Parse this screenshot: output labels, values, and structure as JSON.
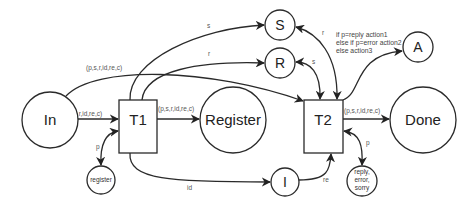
{
  "diagram": {
    "type": "petri-net",
    "places": {
      "in": {
        "label": "In"
      },
      "register_big": {
        "label": "Register"
      },
      "done": {
        "label": "Done"
      },
      "s": {
        "label": "S"
      },
      "r": {
        "label": "R"
      },
      "a": {
        "label": "A"
      },
      "i": {
        "label": "I"
      },
      "register_small": {
        "label": "register"
      },
      "reply": {
        "lines": [
          "reply,",
          "error,",
          "sorry"
        ]
      }
    },
    "transitions": {
      "t1": {
        "label": "T1"
      },
      "t2": {
        "label": "T2"
      }
    },
    "arcs": {
      "in_t1": {
        "label": "(p,s,r,id,re,c)"
      },
      "in_t2": {
        "label": "(p,s,r,id,re,c)"
      },
      "t1_register": {
        "label": "(p,s,r,id,re,c)"
      },
      "t2_done": {
        "label": "(p,s,r,id,re,c)"
      },
      "t1_s": {
        "label": "s"
      },
      "t1_r": {
        "label": "r"
      },
      "s_t2": {
        "label": "r"
      },
      "r_t2": {
        "label": "s"
      },
      "t1_i": {
        "label": "id"
      },
      "i_t2": {
        "label": "re"
      },
      "t1_register_small": {
        "label": "p"
      },
      "t2_reply": {
        "label": "p"
      },
      "t2_a": {
        "guard_lines": [
          "if p=reply action1",
          "else if p=error action2",
          "else action3"
        ]
      }
    }
  }
}
